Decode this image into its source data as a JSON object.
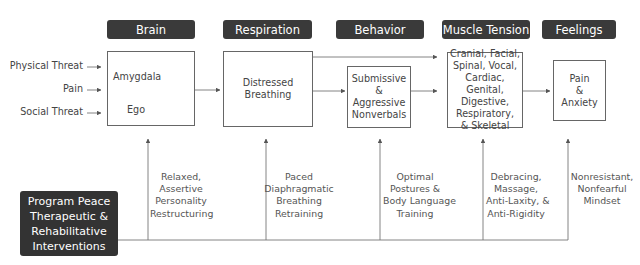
{
  "headers": {
    "brain": "Brain",
    "respiration": "Respiration",
    "behavior": "Behavior",
    "muscle_tension": "Muscle Tension",
    "feelings": "Feelings"
  },
  "inputs": [
    "Physical Threat",
    "Pain",
    "Social Threat"
  ],
  "brain_box": {
    "amygdala": "Amygdala",
    "ego": "Ego"
  },
  "respiration_box": "Distressed Breathing",
  "behavior_box": [
    "Submissive",
    "&",
    "Aggressive",
    "Nonverbals"
  ],
  "muscle_box": [
    "Cranial, Facial,",
    "Spinal, Vocal,",
    "Cardiac, Genital,",
    "Digestive,",
    "Respiratory,",
    "& Skeletal"
  ],
  "feelings_box": [
    "Pain",
    "&",
    "Anxiety"
  ],
  "program": [
    "Program Peace",
    "Therapeutic &",
    "Rehabilitative",
    "Interventions"
  ],
  "interventions": [
    [
      "Relaxed,",
      "Assertive",
      "Personality",
      "Restructuring"
    ],
    [
      "Paced",
      "Diaphragmatic",
      "Breathing",
      "Retraining"
    ],
    [
      "Optimal",
      "Postures &",
      "Body Language",
      "Training"
    ],
    [
      "Debracing,",
      "Massage,",
      "Anti-Laxity, &",
      "Anti-Rigidity"
    ],
    [
      "Nonresistant,",
      "Nonfearful",
      "Mindset"
    ]
  ]
}
